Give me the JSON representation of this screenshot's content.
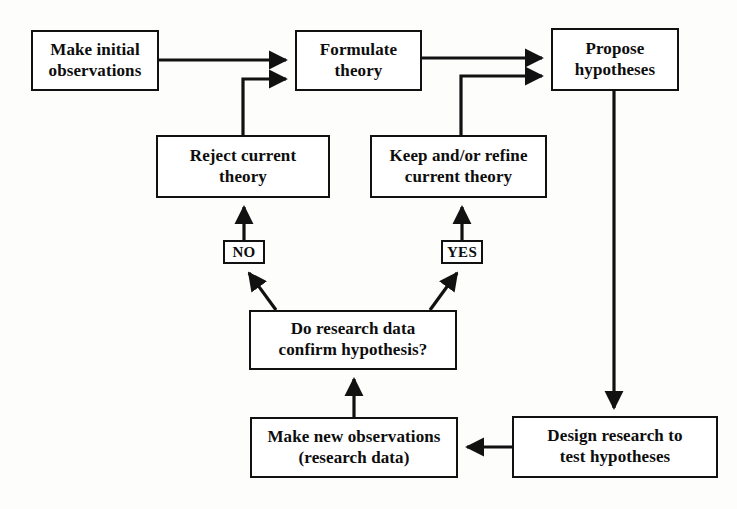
{
  "diagram": {
    "stroke_color": "#111111",
    "box_fill": "#ffffff",
    "background": "#fdfdfc",
    "nodes": [
      {
        "id": "make-initial-observations",
        "text": "Make initial\nobservations",
        "x": 31,
        "y": 30,
        "w": 128,
        "h": 61
      },
      {
        "id": "formulate-theory",
        "text": "Formulate\ntheory",
        "x": 295,
        "y": 30,
        "w": 127,
        "h": 61
      },
      {
        "id": "propose-hypotheses",
        "text": "Propose\nhypotheses",
        "x": 551,
        "y": 28,
        "w": 128,
        "h": 63
      },
      {
        "id": "reject-current-theory",
        "text": "Reject current\ntheory",
        "x": 156,
        "y": 135,
        "w": 174,
        "h": 63
      },
      {
        "id": "keep-refine-current-theory",
        "text": "Keep and/or refine\ncurrent theory",
        "x": 370,
        "y": 135,
        "w": 177,
        "h": 63
      },
      {
        "id": "do-research-data-confirm",
        "text": "Do research data\nconfirm hypothesis?",
        "x": 249,
        "y": 310,
        "w": 208,
        "h": 60
      },
      {
        "id": "make-new-observations",
        "text": "Make new observations\n(research data)",
        "x": 250,
        "y": 417,
        "w": 208,
        "h": 61
      },
      {
        "id": "design-research",
        "text": "Design research to\ntest hypotheses",
        "x": 512,
        "y": 416,
        "w": 206,
        "h": 62
      }
    ],
    "decision_labels": [
      {
        "id": "no-label",
        "text": "NO",
        "x": 223,
        "y": 240,
        "w": 42,
        "h": 24
      },
      {
        "id": "yes-label",
        "text": "YES",
        "x": 441,
        "y": 240,
        "w": 42,
        "h": 24
      }
    ],
    "edges": [
      {
        "id": "observations-to-formulate",
        "from": "make-initial-observations",
        "to": "formulate-theory",
        "label": ""
      },
      {
        "id": "formulate-to-propose",
        "from": "formulate-theory",
        "to": "propose-hypotheses",
        "label": ""
      },
      {
        "id": "reject-to-formulate",
        "from": "reject-current-theory",
        "to": "formulate-theory",
        "label": ""
      },
      {
        "id": "keep-to-propose",
        "from": "keep-refine-current-theory",
        "to": "propose-hypotheses",
        "label": ""
      },
      {
        "id": "propose-to-design",
        "from": "propose-hypotheses",
        "to": "design-research",
        "label": ""
      },
      {
        "id": "design-to-observations",
        "from": "design-research",
        "to": "make-new-observations",
        "label": ""
      },
      {
        "id": "observations-to-decision",
        "from": "make-new-observations",
        "to": "do-research-data-confirm",
        "label": ""
      },
      {
        "id": "decision-to-no",
        "from": "do-research-data-confirm",
        "to": "no-label",
        "label": "NO"
      },
      {
        "id": "decision-to-yes",
        "from": "do-research-data-confirm",
        "to": "yes-label",
        "label": "YES"
      },
      {
        "id": "no-to-reject",
        "from": "no-label",
        "to": "reject-current-theory",
        "label": ""
      },
      {
        "id": "yes-to-keep",
        "from": "yes-label",
        "to": "keep-refine-current-theory",
        "label": ""
      }
    ]
  }
}
